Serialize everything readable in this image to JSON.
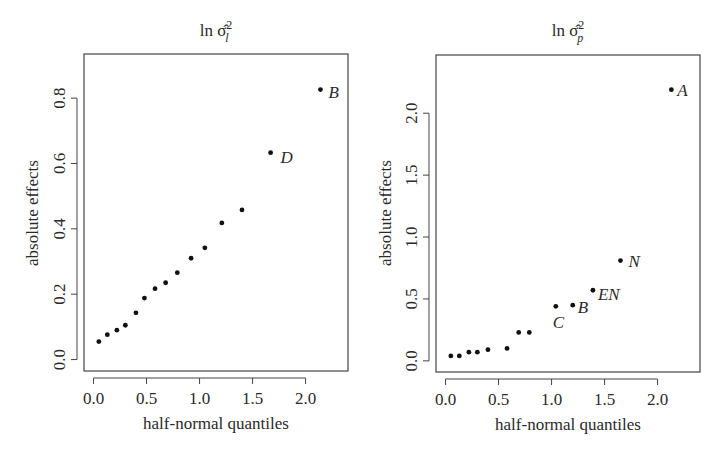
{
  "chart_data": [
    {
      "type": "scatter",
      "title": "ln σ̂²_l",
      "title_parts": {
        "prefix": "ln ",
        "symbol": "σ̂",
        "sup": "2",
        "sub": "l"
      },
      "xlabel": "half-normal quantiles",
      "ylabel": "absolute effects",
      "xlim": [
        -0.09,
        2.4
      ],
      "ylim": [
        -0.035,
        0.935
      ],
      "xticks": [
        0.0,
        0.5,
        1.0,
        1.5,
        2.0
      ],
      "xtick_labels": [
        "0.0",
        "0.5",
        "1.0",
        "1.5",
        "2.0"
      ],
      "yticks": [
        0.0,
        0.2,
        0.4,
        0.6,
        0.8
      ],
      "ytick_labels": [
        "0.0",
        "0.2",
        "0.4",
        "0.6",
        "0.8"
      ],
      "grid": false,
      "legend": null,
      "points": [
        {
          "x": 0.05,
          "y": 0.055,
          "label": ""
        },
        {
          "x": 0.13,
          "y": 0.076,
          "label": ""
        },
        {
          "x": 0.22,
          "y": 0.09,
          "label": ""
        },
        {
          "x": 0.3,
          "y": 0.105,
          "label": ""
        },
        {
          "x": 0.4,
          "y": 0.143,
          "label": ""
        },
        {
          "x": 0.48,
          "y": 0.188,
          "label": ""
        },
        {
          "x": 0.58,
          "y": 0.217,
          "label": ""
        },
        {
          "x": 0.68,
          "y": 0.235,
          "label": ""
        },
        {
          "x": 0.79,
          "y": 0.266,
          "label": ""
        },
        {
          "x": 0.92,
          "y": 0.31,
          "label": ""
        },
        {
          "x": 1.05,
          "y": 0.342,
          "label": ""
        },
        {
          "x": 1.21,
          "y": 0.418,
          "label": ""
        },
        {
          "x": 1.4,
          "y": 0.458,
          "label": ""
        },
        {
          "x": 1.67,
          "y": 0.633,
          "label": "D",
          "label_dx": 10,
          "label_dy": 10
        },
        {
          "x": 2.14,
          "y": 0.826,
          "label": "B",
          "label_dx": 8,
          "label_dy": 8
        }
      ]
    },
    {
      "type": "scatter",
      "title": "ln σ̂²_p",
      "title_parts": {
        "prefix": "ln ",
        "symbol": "σ̂",
        "sup": "2",
        "sub": "p"
      },
      "xlabel": "half-normal quantiles",
      "ylabel": "absolute effects",
      "xlim": [
        -0.09,
        2.4
      ],
      "ylim": [
        -0.09,
        2.47
      ],
      "xticks": [
        0.0,
        0.5,
        1.0,
        1.5,
        2.0
      ],
      "xtick_labels": [
        "0.0",
        "0.5",
        "1.0",
        "1.5",
        "2.0"
      ],
      "yticks": [
        0.0,
        0.5,
        1.0,
        1.5,
        2.0
      ],
      "ytick_labels": [
        "0.0",
        "0.5",
        "1.0",
        "1.5",
        "2.0"
      ],
      "grid": false,
      "legend": null,
      "points": [
        {
          "x": 0.05,
          "y": 0.04,
          "label": ""
        },
        {
          "x": 0.13,
          "y": 0.04,
          "label": ""
        },
        {
          "x": 0.22,
          "y": 0.07,
          "label": ""
        },
        {
          "x": 0.3,
          "y": 0.07,
          "label": ""
        },
        {
          "x": 0.4,
          "y": 0.09,
          "label": ""
        },
        {
          "x": 0.58,
          "y": 0.1,
          "label": ""
        },
        {
          "x": 0.69,
          "y": 0.23,
          "label": ""
        },
        {
          "x": 0.79,
          "y": 0.23,
          "label": ""
        },
        {
          "x": 1.04,
          "y": 0.44,
          "label": "C",
          "label_dx": -3,
          "label_dy": 22
        },
        {
          "x": 1.2,
          "y": 0.45,
          "label": "B",
          "label_dx": 5,
          "label_dy": 8
        },
        {
          "x": 1.39,
          "y": 0.57,
          "label": "EN",
          "label_dx": 5,
          "label_dy": 10
        },
        {
          "x": 1.65,
          "y": 0.81,
          "label": "N",
          "label_dx": 8,
          "label_dy": 6
        },
        {
          "x": 2.13,
          "y": 2.19,
          "label": "A",
          "label_dx": 6,
          "label_dy": 6
        }
      ]
    }
  ],
  "panels": [
    {
      "title_prefix": "ln ",
      "title_symbol": "σ̂",
      "title_sup": "2",
      "title_sub": "l",
      "xlabel": "half-normal quantiles",
      "ylabel": "absolute effects"
    },
    {
      "title_prefix": "ln ",
      "title_symbol": "σ̂",
      "title_sup": "2",
      "title_sub": "p",
      "xlabel": "half-normal quantiles",
      "ylabel": "absolute effects"
    }
  ],
  "style": {
    "point_color": "#111111",
    "axis_color": "#444444",
    "text_color": "#2a2a2a",
    "background": "#ffffff"
  }
}
